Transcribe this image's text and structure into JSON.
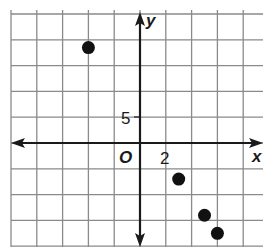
{
  "chart_data": {
    "type": "scatter",
    "title": "",
    "xlabel": "x",
    "ylabel": "y",
    "origin_label": "O",
    "x_tick_label": "2",
    "y_tick_label": "5",
    "x_grid_step": 2,
    "y_grid_step": 5,
    "xlim": [
      -10,
      9.5
    ],
    "ylim": [
      -20,
      25
    ],
    "grid": true,
    "points": [
      {
        "x": -4,
        "y": 18.5
      },
      {
        "x": 3,
        "y": -7
      },
      {
        "x": 5,
        "y": -14
      },
      {
        "x": 6,
        "y": -17.5
      }
    ]
  },
  "style": {
    "grid_color": "#8a8a8a",
    "axis_color": "#1a1a1a",
    "point_color": "#111111"
  }
}
